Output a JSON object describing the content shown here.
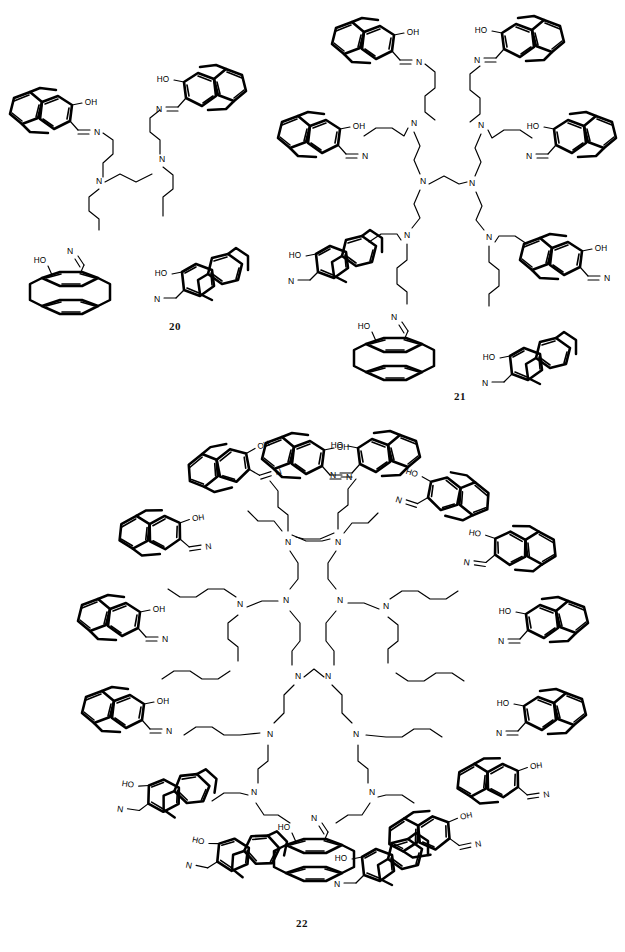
{
  "document": {
    "type": "chemical-structure-figure",
    "background_color": "#ffffff",
    "ink_color": "#000000",
    "width": 625,
    "height": 952,
    "description": "Three generations of poly(propylene imine) dendrimers bearing 4-hydroxy[2.2]paracyclophane-carbaldimine (salicylaldimine-type) end groups."
  },
  "structures": [
    {
      "id": "structure-20",
      "label": "20",
      "label_x": 175,
      "label_y": 327,
      "generation": 1,
      "core": "1,2-diaminoethane (DAB) core",
      "core_nitrogens": 2,
      "terminal_groups": 4,
      "branch_spacer": "propylene (trimethylene)",
      "terminal_unit": "4-hydroxy[2.2]paracyclophane-5-carbaldimine",
      "atom_labels": [
        "OH",
        "HO",
        "N"
      ],
      "region": {
        "x": 8,
        "y": 40,
        "w": 260,
        "h": 300
      }
    },
    {
      "id": "structure-21",
      "label": "21",
      "label_x": 455,
      "label_y": 403,
      "generation": 2,
      "core": "1,2-diaminoethane (DAB) core",
      "core_nitrogens": 2,
      "branching_nitrogens": 4,
      "terminal_groups": 8,
      "branch_spacer": "propylene (trimethylene)",
      "terminal_unit": "4-hydroxy[2.2]paracyclophane-5-carbaldimine",
      "atom_labels": [
        "OH",
        "HO",
        "N"
      ],
      "region": {
        "x": 270,
        "y": 8,
        "w": 352,
        "h": 390
      }
    },
    {
      "id": "structure-22",
      "label": "22",
      "label_x": 303,
      "label_y": 930,
      "generation": 3,
      "core": "1,2-diaminoethane (DAB) core",
      "core_nitrogens": 2,
      "branching_nitrogens": 12,
      "terminal_groups": 16,
      "branch_spacer": "propylene (trimethylene)",
      "terminal_unit": "4-hydroxy[2.2]paracyclophane-5-carbaldimine",
      "atom_labels": [
        "OH",
        "HO",
        "N"
      ],
      "region": {
        "x": 58,
        "y": 430,
        "w": 510,
        "h": 480
      }
    }
  ],
  "atoms": {
    "nitrogen": "N",
    "hydroxyl_right": "OH",
    "hydroxyl_left": "HO"
  }
}
